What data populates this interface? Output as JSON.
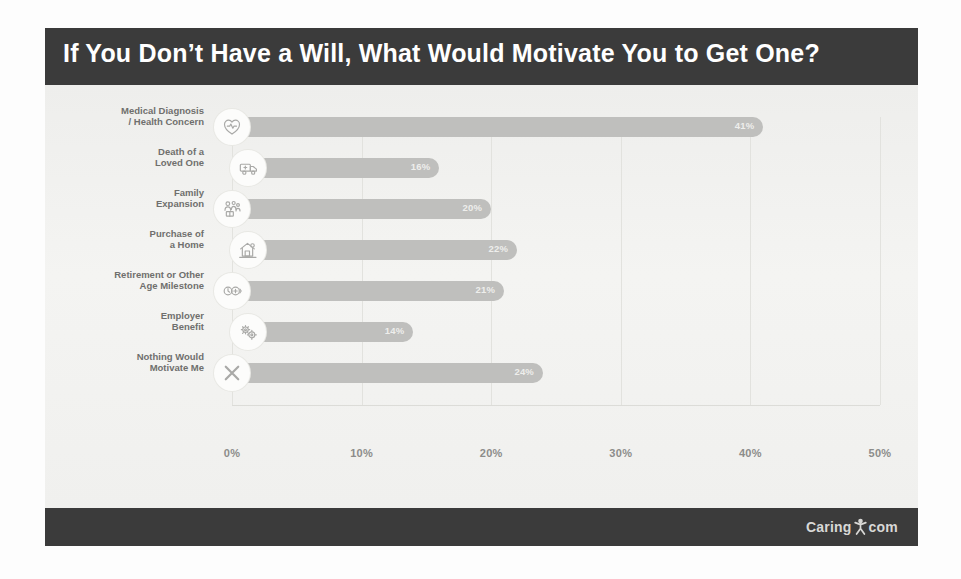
{
  "header": {
    "title": "If You Don’t Have a Will, What Would Motivate You to Get One?"
  },
  "footer": {
    "brand_left": "Caring",
    "brand_right": "com",
    "logo_icon": "person-figure-icon"
  },
  "colors": {
    "header_band": "#3b3b3b",
    "footer_band": "#3b3b3b",
    "bar": "#bfbfbd",
    "canvas": "#f0f0ee",
    "bar_label": "#eeeeec",
    "category_label": "#6f6f6d",
    "tick_label": "#8c8c8a",
    "gridline": "#e2e2de"
  },
  "chart_data": {
    "type": "bar",
    "orientation": "horizontal",
    "title": "If You Don’t Have a Will, What Would Motivate You to Get One?",
    "xlabel": "",
    "ylabel": "",
    "xlim": [
      0,
      50
    ],
    "grid": true,
    "legend": "none",
    "tick_labels": [
      "0%",
      "10%",
      "20%",
      "30%",
      "40%",
      "50%"
    ],
    "ticks": [
      0,
      10,
      20,
      30,
      40,
      50
    ],
    "categories": [
      "Medical Diagnosis / Health Concern",
      "Death of a Loved One",
      "Family Expansion",
      "Purchase of a Home",
      "Retirement or Other Age Milestone",
      "Employer Benefit",
      "Nothing Would Motivate Me"
    ],
    "values": [
      41,
      16,
      20,
      22,
      21,
      14,
      24
    ],
    "value_labels": [
      "41%",
      "16%",
      "20%",
      "22%",
      "21%",
      "14%",
      "24%"
    ],
    "bars": [
      {
        "line1": "Medical Diagnosis",
        "line2": "/ Health Concern",
        "value": 41,
        "label": "41%",
        "icon": "heart-pulse-icon"
      },
      {
        "line1": "Death of a",
        "line2": "Loved One",
        "value": 16,
        "label": "16%",
        "icon": "ambulance-icon"
      },
      {
        "line1": "Family",
        "line2": "Expansion",
        "value": 20,
        "label": "20%",
        "icon": "family-group-icon"
      },
      {
        "line1": "Purchase of",
        "line2": "a Home",
        "value": 22,
        "label": "22%",
        "icon": "house-icon"
      },
      {
        "line1": "Retirement or Other",
        "line2": "Age Milestone",
        "value": 21,
        "label": "21%",
        "icon": "retirement-clock-icon"
      },
      {
        "line1": "Employer",
        "line2": "Benefit",
        "value": 14,
        "label": "14%",
        "icon": "gears-icon"
      },
      {
        "line1": "Nothing Would",
        "line2": "Motivate Me",
        "value": 24,
        "label": "24%",
        "icon": "x-cross-icon"
      }
    ]
  }
}
